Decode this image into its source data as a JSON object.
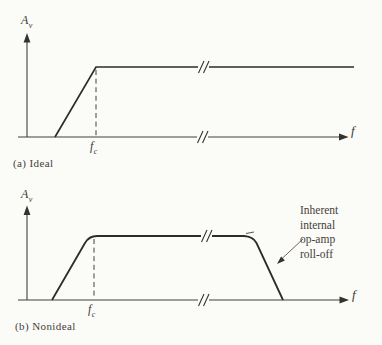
{
  "figure": {
    "background": "#fbfbf8",
    "ink": "#35322e",
    "panels": [
      {
        "caption": "(a) Ideal",
        "y_axis_label": {
          "base": "A",
          "sub": "v"
        },
        "x_axis_label": "f",
        "corner_freq_label": {
          "base": "f",
          "sub": "c"
        }
      },
      {
        "caption": "(b) Nonideal",
        "y_axis_label": {
          "base": "A",
          "sub": "v"
        },
        "x_axis_label": "f",
        "corner_freq_label": {
          "base": "f",
          "sub": "c"
        },
        "annotation": {
          "lines": [
            "Inherent",
            "internal",
            "op-amp",
            "roll-off"
          ]
        }
      }
    ]
  }
}
